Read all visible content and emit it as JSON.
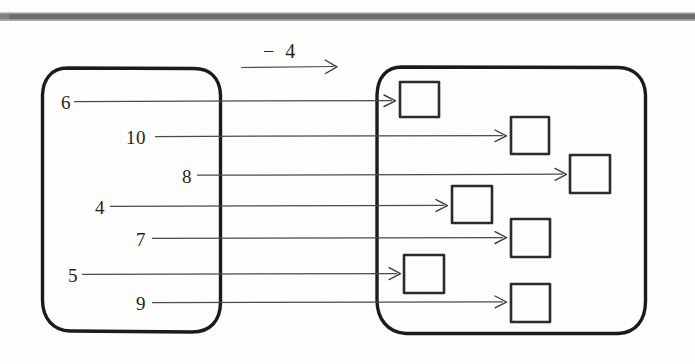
{
  "worksheet": {
    "title": "Function machine mapping diagram",
    "rule": {
      "label": "− 4",
      "operation": "subtract",
      "operand": 4
    },
    "input_set": {
      "name": "input-oval",
      "values": [
        "6",
        "10",
        "8",
        "4",
        "7",
        "5",
        "9"
      ]
    },
    "output_set": {
      "name": "output-oval",
      "box_count": 7,
      "values": [
        "",
        "",
        "",
        "",
        "",
        "",
        ""
      ]
    },
    "mappings": [
      {
        "input": "6",
        "output": ""
      },
      {
        "input": "10",
        "output": ""
      },
      {
        "input": "8",
        "output": ""
      },
      {
        "input": "4",
        "output": ""
      },
      {
        "input": "7",
        "output": ""
      },
      {
        "input": "5",
        "output": ""
      },
      {
        "input": "9",
        "output": ""
      }
    ]
  },
  "colors": {
    "ink": "#1b1b1b",
    "line": "#4a4a4a",
    "paper": "#fdfdfc",
    "scan_band": "#6e6e6e"
  }
}
